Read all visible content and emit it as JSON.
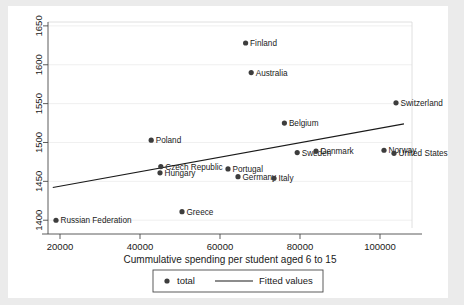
{
  "chart_data": {
    "type": "scatter",
    "title": "",
    "xlabel": "Cummulative spending per student aged 6 to 15",
    "ylabel": "",
    "xlim": [
      17000,
      108000
    ],
    "ylim": [
      1390,
      1655
    ],
    "xticks": [
      "20000",
      "40000",
      "60000",
      "80000",
      "100000"
    ],
    "xtick_values": [
      20000,
      40000,
      60000,
      80000,
      100000
    ],
    "yticks": [
      "1400",
      "1450",
      "1500",
      "1550",
      "1600",
      "1650"
    ],
    "ytick_values": [
      1400,
      1450,
      1500,
      1550,
      1600,
      1650
    ],
    "grid": true,
    "legend_position": "bottom-center",
    "series": [
      {
        "name": "total",
        "type": "scatter",
        "marker": "circle",
        "color": "#3d3d3d",
        "points": [
          {
            "label": "Russian Federation",
            "x": 19000,
            "y": 1400,
            "label_side": "right"
          },
          {
            "label": "Poland",
            "x": 42800,
            "y": 1503,
            "label_side": "right"
          },
          {
            "label": "Czech Republic",
            "x": 45200,
            "y": 1469,
            "label_side": "right"
          },
          {
            "label": "Hungary",
            "x": 45000,
            "y": 1461,
            "label_side": "right"
          },
          {
            "label": "Greece",
            "x": 50500,
            "y": 1411,
            "label_side": "right"
          },
          {
            "label": "Portugal",
            "x": 62000,
            "y": 1466,
            "label_side": "right"
          },
          {
            "label": "Germany",
            "x": 64500,
            "y": 1456,
            "label_side": "right"
          },
          {
            "label": "Finland",
            "x": 66400,
            "y": 1628,
            "label_side": "right"
          },
          {
            "label": "Australia",
            "x": 67800,
            "y": 1590,
            "label_side": "right"
          },
          {
            "label": "Italy",
            "x": 73500,
            "y": 1454,
            "label_side": "right"
          },
          {
            "label": "Belgium",
            "x": 76100,
            "y": 1525,
            "label_side": "right"
          },
          {
            "label": "Sweden",
            "x": 79300,
            "y": 1487,
            "label_side": "right"
          },
          {
            "label": "Denmark",
            "x": 84000,
            "y": 1489,
            "label_side": "right"
          },
          {
            "label": "Norway",
            "x": 101000,
            "y": 1490,
            "label_side": "right"
          },
          {
            "label": "United States",
            "x": 103500,
            "y": 1486,
            "label_side": "right"
          },
          {
            "label": "Switzerland",
            "x": 104000,
            "y": 1551,
            "label_side": "right"
          }
        ]
      },
      {
        "name": "Fitted values",
        "type": "line",
        "color": "#1a1a1a",
        "endpoints": [
          {
            "x": 18200,
            "y": 1442
          },
          {
            "x": 106000,
            "y": 1524
          }
        ]
      }
    ],
    "legend": [
      {
        "label": "total",
        "glyph": "circle-marker"
      },
      {
        "label": "Fitted values",
        "glyph": "line-segment"
      }
    ]
  }
}
